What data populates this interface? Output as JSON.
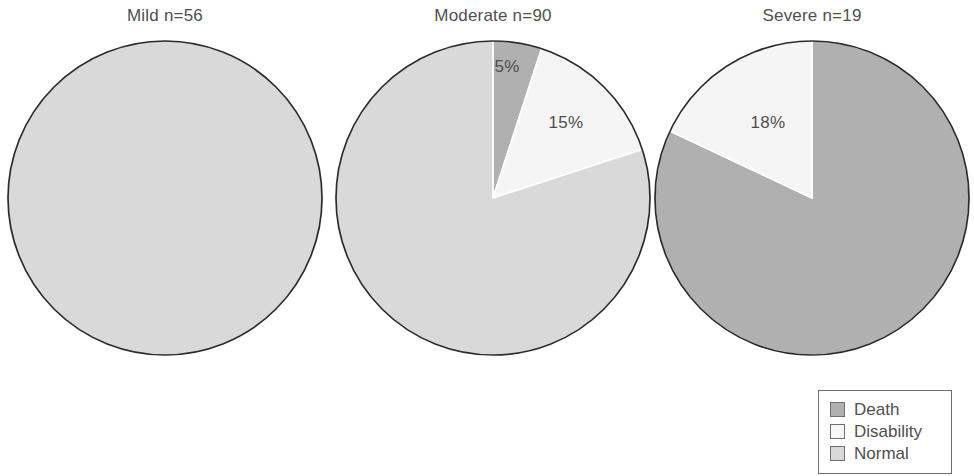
{
  "chart_data": {
    "type": "pie",
    "title": "",
    "subtitle": "",
    "layout": {
      "panels": 3,
      "grid": false,
      "legend_position": "bottom-right",
      "start_angle_deg": 0,
      "direction": "clockwise",
      "outline_color": "#2b2b2b"
    },
    "categories": [
      "Death",
      "Disability",
      "Normal"
    ],
    "colors": {
      "Death": "#b0b0b0",
      "Disability": "#f5f5f5",
      "Normal": "#d9d9d9"
    },
    "panels": [
      {
        "key": "mild",
        "title": "Mild n=56",
        "group": "Mild",
        "n": 56,
        "center_x": 165,
        "center_y": 198,
        "radius": 157,
        "slices": [
          {
            "name": "Death",
            "value": 0,
            "label": "",
            "show_label": false
          },
          {
            "name": "Disability",
            "value": 0,
            "label": "",
            "show_label": false
          },
          {
            "name": "Normal",
            "value": 100,
            "label": "100%",
            "show_label": false
          }
        ]
      },
      {
        "key": "moderate",
        "title": "Moderate n=90",
        "group": "Moderate",
        "n": 90,
        "center_x": 493,
        "center_y": 198,
        "radius": 157,
        "slices": [
          {
            "name": "Death",
            "value": 5,
            "label": "5%",
            "show_label": true,
            "label_x": 507,
            "label_y": 72
          },
          {
            "name": "Disability",
            "value": 15,
            "label": "15%",
            "show_label": true,
            "label_x": 566,
            "label_y": 128
          },
          {
            "name": "Normal",
            "value": 80,
            "label": "80%",
            "show_label": false
          }
        ]
      },
      {
        "key": "severe",
        "title": "Severe n=19",
        "group": "Severe",
        "n": 19,
        "center_x": 812,
        "center_y": 198,
        "radius": 157,
        "slices": [
          {
            "name": "Death",
            "value": 82,
            "label": "82%",
            "show_label": false
          },
          {
            "name": "Disability",
            "value": 18,
            "label": "18%",
            "show_label": true,
            "label_x": 768,
            "label_y": 128
          },
          {
            "name": "Normal",
            "value": 0,
            "label": "",
            "show_label": false
          }
        ]
      }
    ],
    "legend": {
      "x": 818,
      "y": 390,
      "width": 134,
      "height": 84,
      "entries": [
        {
          "label": "Death",
          "color": "#b0b0b0"
        },
        {
          "label": "Disability",
          "color": "#f7f7f7"
        },
        {
          "label": "Normal",
          "color": "#d9d9d9"
        }
      ]
    }
  }
}
